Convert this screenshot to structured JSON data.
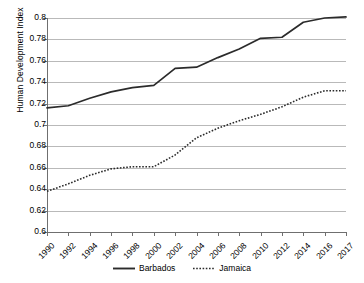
{
  "chart_data": {
    "type": "line",
    "title": "",
    "xlabel": "",
    "ylabel": "Human Development Index",
    "ylim": [
      0.6,
      0.8
    ],
    "ytick_step": 0.02,
    "yticks": [
      "0.8",
      "0.78",
      "0.76",
      "0.74",
      "0.72",
      "0.7",
      "0.68",
      "0.66",
      "0.64",
      "0.62",
      "0.6"
    ],
    "ytick_values": [
      0.8,
      0.78,
      0.76,
      0.74,
      0.72,
      0.7,
      0.68,
      0.66,
      0.64,
      0.62,
      0.6
    ],
    "categories": [
      "1990",
      "1992",
      "1994",
      "1996",
      "1998",
      "2000",
      "2002",
      "2004",
      "2006",
      "2008",
      "2010",
      "2012",
      "2014",
      "2016",
      "2017"
    ],
    "grid": "horizontal",
    "legend_position": "bottom",
    "series": [
      {
        "name": "Barbados",
        "style": "solid",
        "color": "#2b2b2b",
        "values": [
          0.716,
          0.718,
          0.725,
          0.731,
          0.735,
          0.737,
          0.753,
          0.754,
          0.763,
          0.771,
          0.781,
          0.782,
          0.796,
          0.8,
          0.801
        ]
      },
      {
        "name": "Jamaica",
        "style": "dotted",
        "color": "#2b2b2b",
        "values": [
          0.638,
          0.645,
          0.653,
          0.659,
          0.661,
          0.661,
          0.672,
          0.688,
          0.697,
          0.704,
          0.71,
          0.717,
          0.726,
          0.732,
          0.732
        ]
      }
    ]
  },
  "legend": {
    "items": [
      {
        "label": "Barbados",
        "style": "solid"
      },
      {
        "label": "Jamaica",
        "style": "dotted"
      }
    ]
  },
  "axes": {
    "y_title": "Human Development Index"
  },
  "colors": {
    "line": "#2b2b2b",
    "grid": "#b9b9b9",
    "axis": "#6f6f6f",
    "background": "#ffffff",
    "text": "#000000"
  }
}
